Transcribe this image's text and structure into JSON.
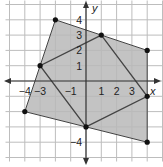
{
  "graph": {
    "x_axis_label": "x",
    "y_axis_label": "y",
    "x_range": [
      -5,
      5
    ],
    "y_range": [
      -5,
      5
    ],
    "x_tick_labels": [
      {
        "value": -4,
        "label": "−4"
      },
      {
        "value": -3,
        "label": "−3"
      },
      {
        "value": -1,
        "label": "−1"
      },
      {
        "value": 1,
        "label": "1"
      },
      {
        "value": 2,
        "label": "2"
      },
      {
        "value": 3,
        "label": "3"
      }
    ],
    "y_tick_labels": [
      {
        "value": 4,
        "label": "4"
      },
      {
        "value": 3,
        "label": "3"
      },
      {
        "value": 2,
        "label": "2"
      },
      {
        "value": 1,
        "label": "1"
      },
      {
        "value": -4,
        "label": "−4"
      }
    ],
    "outer_quadrilateral": {
      "vertices": [
        [
          -2,
          4
        ],
        [
          4,
          2
        ],
        [
          4,
          -4
        ],
        [
          -4,
          -2
        ]
      ],
      "fill": "#b8b8b8"
    },
    "inner_quadrilateral": {
      "vertices": [
        [
          1,
          3
        ],
        [
          4,
          -1
        ],
        [
          0,
          -3
        ],
        [
          -3,
          1
        ]
      ]
    },
    "colors": {
      "grid": "#bdbdbd",
      "axis": "#333333",
      "shape_stroke": "#444444",
      "point": "#111111",
      "background": "#ffffff"
    }
  }
}
